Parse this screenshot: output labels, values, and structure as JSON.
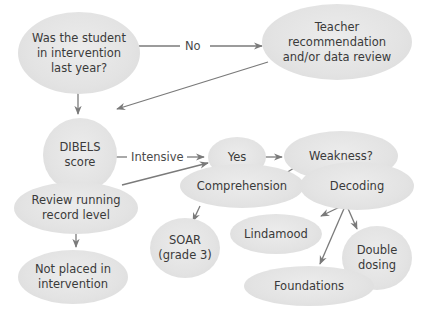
{
  "diagram": {
    "type": "flowchart",
    "colors": {
      "node_fill": "#e3e3e3",
      "edge": "#7a7a7a",
      "text": "#3a3a3a",
      "background": "#ffffff"
    },
    "nodes": [
      {
        "id": "in_intervention",
        "label": "Was the student\nin intervention\nlast year?"
      },
      {
        "id": "teacher_rec",
        "label": "Teacher\nrecommendation\nand/or data review"
      },
      {
        "id": "dibels",
        "label": "DIBELS\nscore"
      },
      {
        "id": "yes",
        "label": "Yes"
      },
      {
        "id": "weakness",
        "label": "Weakness?"
      },
      {
        "id": "review_record",
        "label": "Review running\nrecord level"
      },
      {
        "id": "comprehension",
        "label": "Comprehension"
      },
      {
        "id": "decoding",
        "label": "Decoding"
      },
      {
        "id": "soar",
        "label": "SOAR\n(grade 3)"
      },
      {
        "id": "lindamood",
        "label": "Lindamood"
      },
      {
        "id": "double_dosing",
        "label": "Double\ndosing"
      },
      {
        "id": "not_placed",
        "label": "Not placed in\nintervention"
      },
      {
        "id": "foundations",
        "label": "Foundations"
      }
    ],
    "edges": [
      {
        "from": "in_intervention",
        "to": "teacher_rec",
        "label": "No"
      },
      {
        "from": "in_intervention",
        "to": "dibels",
        "label": ""
      },
      {
        "from": "teacher_rec",
        "to": "dibels",
        "label": ""
      },
      {
        "from": "dibels",
        "to": "yes",
        "label": "Intensive"
      },
      {
        "from": "dibels",
        "to": "review_record",
        "label": ""
      },
      {
        "from": "review_record",
        "to": "yes",
        "label": ""
      },
      {
        "from": "review_record",
        "to": "not_placed",
        "label": ""
      },
      {
        "from": "yes",
        "to": "weakness",
        "label": ""
      },
      {
        "from": "weakness",
        "to": "comprehension",
        "label": ""
      },
      {
        "from": "weakness",
        "to": "decoding",
        "label": ""
      },
      {
        "from": "comprehension",
        "to": "soar",
        "label": ""
      },
      {
        "from": "decoding",
        "to": "lindamood",
        "label": ""
      },
      {
        "from": "decoding",
        "to": "foundations",
        "label": ""
      },
      {
        "from": "decoding",
        "to": "double_dosing",
        "label": ""
      }
    ]
  }
}
